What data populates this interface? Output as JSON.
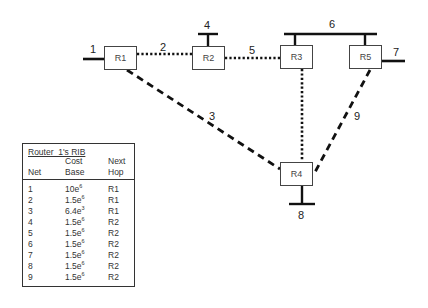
{
  "diagram": {
    "type": "network-topology",
    "routers": [
      {
        "id": "R1",
        "label": "R1"
      },
      {
        "id": "R2",
        "label": "R2"
      },
      {
        "id": "R3",
        "label": "R3"
      },
      {
        "id": "R4",
        "label": "R4"
      },
      {
        "id": "R5",
        "label": "R5"
      }
    ],
    "networks": [
      {
        "label": "1",
        "style": "solid-stub",
        "connects": [
          "R1"
        ]
      },
      {
        "label": "2",
        "style": "dotted",
        "connects": [
          "R1",
          "R2"
        ]
      },
      {
        "label": "3",
        "style": "dashed",
        "connects": [
          "R1",
          "R4"
        ]
      },
      {
        "label": "4",
        "style": "solid-stub",
        "connects": [
          "R2"
        ]
      },
      {
        "label": "5",
        "style": "dotted",
        "connects": [
          "R2",
          "R3"
        ]
      },
      {
        "label": "6",
        "style": "solid-bus",
        "connects": [
          "R3",
          "R5"
        ]
      },
      {
        "label": "7",
        "style": "solid-stub",
        "connects": [
          "R5"
        ]
      },
      {
        "label": "8",
        "style": "solid-stub",
        "connects": [
          "R4"
        ]
      },
      {
        "label": "9",
        "style": "dashed",
        "connects": [
          "R5",
          "R4"
        ]
      },
      {
        "label": "",
        "style": "dotted",
        "connects": [
          "R3",
          "R4"
        ]
      }
    ]
  },
  "rib": {
    "title": "Router  1's RIB",
    "headers": {
      "net": "Net",
      "cost_line1": "Cost",
      "cost_line2": "Base",
      "hop_line1": "Next",
      "hop_line2": "Hop"
    },
    "rows": [
      {
        "net": "1",
        "cost_base": "10e",
        "cost_exp": "6",
        "next_hop": "R1"
      },
      {
        "net": "2",
        "cost_base": "1.5e",
        "cost_exp": "6",
        "next_hop": "R1"
      },
      {
        "net": "3",
        "cost_base": "6.4e",
        "cost_exp": "3",
        "next_hop": "R1"
      },
      {
        "net": "4",
        "cost_base": "1.5e",
        "cost_exp": "6",
        "next_hop": "R2"
      },
      {
        "net": "5",
        "cost_base": "1.5e",
        "cost_exp": "6",
        "next_hop": "R2"
      },
      {
        "net": "6",
        "cost_base": "1.5e",
        "cost_exp": "6",
        "next_hop": "R2"
      },
      {
        "net": "7",
        "cost_base": "1.5e",
        "cost_exp": "6",
        "next_hop": "R2"
      },
      {
        "net": "8",
        "cost_base": "1.5e",
        "cost_exp": "6",
        "next_hop": "R2"
      },
      {
        "net": "9",
        "cost_base": "1.5e",
        "cost_exp": "6",
        "next_hop": "R2"
      }
    ]
  },
  "colors": {
    "line": "#111111",
    "box_border": "#444444",
    "text": "#222222"
  }
}
